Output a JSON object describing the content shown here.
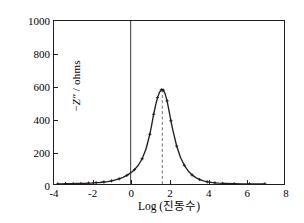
{
  "chart_data": {
    "type": "line",
    "title": "",
    "xlabel": "Log (진동수)",
    "ylabel": "−Z″ / ohms",
    "ylabel_parts": {
      "minus": "−",
      "symbol": "Z″",
      "units": " / ohms"
    },
    "xlim": [
      -4,
      8
    ],
    "ylim": [
      0,
      1000
    ],
    "xticks": [
      -4,
      -2,
      0,
      2,
      4,
      6,
      8
    ],
    "xtick_labels": [
      "-4",
      "-2",
      "0",
      "2",
      "4",
      "6",
      "8"
    ],
    "yticks": [
      0,
      200,
      400,
      600,
      800,
      1000
    ],
    "ytick_labels": [
      "0",
      "200",
      "400",
      "600",
      "800",
      "1000"
    ],
    "grid": false,
    "legend": null,
    "markers": "plus",
    "line_color": "#231f20",
    "marker_color": "#231f20",
    "series": [
      {
        "name": "-Z″",
        "x": [
          -3.8,
          -3.6,
          -3.4,
          -3.2,
          -3.0,
          -2.8,
          -2.6,
          -2.4,
          -2.2,
          -2.0,
          -1.8,
          -1.6,
          -1.4,
          -1.2,
          -1.0,
          -0.8,
          -0.6,
          -0.4,
          -0.2,
          0.0,
          0.2,
          0.4,
          0.6,
          0.8,
          1.0,
          1.1,
          1.2,
          1.3,
          1.4,
          1.5,
          1.6,
          1.65,
          1.7,
          1.8,
          1.9,
          2.0,
          2.1,
          2.2,
          2.4,
          2.6,
          2.8,
          3.0,
          3.2,
          3.4,
          3.6,
          3.8,
          4.0,
          4.2,
          4.4,
          4.6,
          4.8,
          5.0,
          5.4,
          5.8,
          6.2,
          6.6,
          7.0
        ],
        "y": [
          1,
          1,
          2,
          2,
          2,
          3,
          3,
          4,
          5,
          6,
          8,
          9,
          12,
          15,
          19,
          25,
          32,
          41,
          53,
          68,
          88,
          115,
          155,
          215,
          305,
          365,
          428,
          482,
          530,
          562,
          578,
          580,
          576,
          553,
          510,
          450,
          388,
          330,
          233,
          163,
          115,
          80,
          56,
          39,
          27,
          19,
          13,
          10,
          7,
          5,
          4,
          3,
          2,
          1,
          1,
          1,
          1
        ]
      }
    ],
    "annotations": [
      {
        "type": "vline",
        "name": "peak-marker-line",
        "x": 1.65,
        "style": "dashed",
        "color": "#6d6e71",
        "y_from": 0,
        "y_to": 580,
        "label": ""
      },
      {
        "type": "vline",
        "name": "zero-axis-line",
        "x": 0,
        "style": "solid",
        "color": "#231f20",
        "y_from": 0,
        "y_to": 1000,
        "label": ""
      }
    ],
    "peak": {
      "x": 1.65,
      "y": 580,
      "label": ""
    }
  }
}
